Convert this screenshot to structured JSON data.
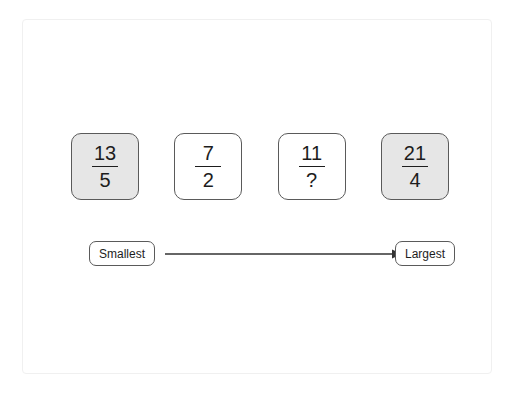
{
  "diagram": {
    "cards": [
      {
        "numerator": "13",
        "denominator": "5",
        "shaded": true,
        "name": "fraction-card-1"
      },
      {
        "numerator": "7",
        "denominator": "2",
        "shaded": false,
        "name": "fraction-card-2"
      },
      {
        "numerator": "11",
        "denominator": "?",
        "shaded": false,
        "name": "fraction-card-3"
      },
      {
        "numerator": "21",
        "denominator": "4",
        "shaded": true,
        "name": "fraction-card-4"
      }
    ],
    "scale": {
      "smallest_label": "Smallest",
      "largest_label": "Largest",
      "arrow_direction": "right"
    },
    "colors": {
      "card_border": "#5a5a5a",
      "card_fill_shaded": "#e6e6e6",
      "card_fill_plain": "#ffffff",
      "text": "#1d1d1d",
      "arrow": "#333333",
      "frame_border": "#f0f0f0"
    }
  }
}
